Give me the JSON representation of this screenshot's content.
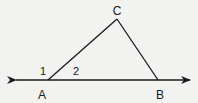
{
  "diagram": {
    "type": "geometry-triangle",
    "background": "#f2f2f0",
    "stroke_color": "#1a1a1a",
    "points": {
      "A": {
        "label": "A",
        "x": 48,
        "y": 80
      },
      "B": {
        "label": "B",
        "x": 158,
        "y": 80
      },
      "C": {
        "label": "C",
        "x": 117,
        "y": 19
      }
    },
    "line": {
      "x1": 16,
      "x2": 190,
      "y": 80,
      "arrows": "both"
    },
    "segments": [
      [
        "A",
        "C"
      ],
      [
        "C",
        "B"
      ]
    ],
    "angle_labels": [
      {
        "label": "1",
        "x": 43,
        "y": 75
      },
      {
        "label": "2",
        "x": 76,
        "y": 75
      }
    ],
    "vertex_labels": [
      {
        "label": "A",
        "x": 42,
        "y": 99
      },
      {
        "label": "B",
        "x": 160,
        "y": 99
      },
      {
        "label": "C",
        "x": 117,
        "y": 15
      }
    ]
  }
}
